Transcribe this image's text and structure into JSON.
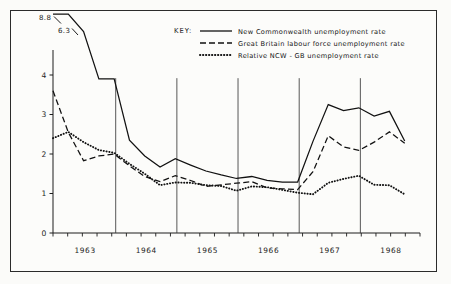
{
  "figure": {
    "background_color": "#fbfbf9",
    "frame_color": "#2b2b2b",
    "ink_color": "#1c1c1c"
  },
  "legend": {
    "heading": "KEY:",
    "position": "top-center",
    "entries": [
      {
        "style": "solid",
        "label": "New Commonwealth  unemployment rate"
      },
      {
        "style": "dashed",
        "label": "Great Britain labour force unemployment rate"
      },
      {
        "style": "dotted",
        "label": "Relative NCW - GB unemployment rate"
      }
    ]
  },
  "annotations": [
    {
      "text": "8.8",
      "note": "off-scale first point of New Commonwealth series"
    },
    {
      "text": "6.3",
      "note": "off-scale second point of New Commonwealth series"
    }
  ],
  "chart_data": {
    "type": "line",
    "title": "",
    "subtitle": "",
    "xlabel": "",
    "ylabel": "",
    "xlim": [
      0,
      24
    ],
    "ylim": [
      0,
      4.45
    ],
    "grid": "vertical-year-markers-only",
    "legend_position": "top-center",
    "y_ticks": [
      0,
      1,
      2,
      3,
      4
    ],
    "y_tick_labels": [
      "0",
      "1",
      "2",
      "3",
      "4"
    ],
    "x_tick_labels": [
      "1963",
      "1964",
      "1965",
      "1966",
      "1967",
      "1968"
    ],
    "x_tick_positions": [
      2.1,
      6.1,
      10.1,
      14.1,
      18.1,
      22.1
    ],
    "x_minor_tick_count": 25,
    "vertical_marker_positions": [
      4.1,
      8.1,
      12.1,
      16.1,
      20.1
    ],
    "x_values": [
      0,
      1,
      2,
      3,
      4,
      5,
      6,
      7,
      8,
      9,
      10,
      11,
      12,
      13,
      14,
      15,
      16,
      17,
      18,
      19,
      20,
      21,
      22,
      23
    ],
    "series": [
      {
        "name": "New Commonwealth  unemployment rate",
        "style": "solid",
        "clipped_values_note": "first two points plotted off the top of the axis and labelled 8.8 and 6.3",
        "values": [
          8.8,
          6.3,
          5.1,
          3.9,
          3.9,
          2.35,
          1.95,
          1.67,
          1.88,
          1.72,
          1.57,
          1.47,
          1.38,
          1.43,
          1.33,
          1.29,
          1.29,
          2.32,
          3.25,
          3.1,
          3.17,
          2.96,
          3.08,
          2.33
        ]
      },
      {
        "name": "Great Britain labour force unemployment rate",
        "style": "dashed",
        "values": [
          3.6,
          2.55,
          1.83,
          1.95,
          2.0,
          1.7,
          1.43,
          1.3,
          1.45,
          1.33,
          1.18,
          1.22,
          1.26,
          1.3,
          1.14,
          1.12,
          1.1,
          1.55,
          2.46,
          2.18,
          2.09,
          2.3,
          2.56,
          2.27
        ]
      },
      {
        "name": "Relative NCW - GB unemployment rate",
        "style": "dotted",
        "values": [
          2.4,
          2.56,
          2.3,
          2.1,
          2.03,
          1.75,
          1.5,
          1.21,
          1.28,
          1.27,
          1.21,
          1.19,
          1.07,
          1.18,
          1.16,
          1.09,
          1.02,
          0.98,
          1.27,
          1.37,
          1.45,
          1.22,
          1.21,
          0.98
        ]
      }
    ]
  }
}
